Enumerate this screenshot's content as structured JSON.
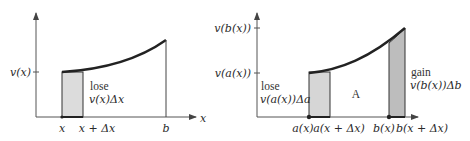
{
  "figure": {
    "left_panel": {
      "y_tick_label": "v(x)",
      "x_axis_label": "x",
      "x_ticks": [
        "x",
        "x + Δx",
        "b"
      ],
      "annotation_line1": "lose",
      "annotation_line2": "v(x)Δx"
    },
    "right_panel": {
      "y_tick_labels": [
        "v(b(x))",
        "v(a(x))"
      ],
      "x_axis_label": "x",
      "x_ticks": [
        "a(x)",
        "a(x + Δx)",
        "b(x)",
        "b(x + Δx)"
      ],
      "lose_line1": "lose",
      "lose_line2": "v(a(x))Δa",
      "gain_line1": "gain",
      "gain_line2": "v(b(x))Δb",
      "region_label": "A"
    },
    "colors": {
      "stroke": "#2b2b2b",
      "shade_light": "#d9d9d9",
      "shade_dark": "#b8b8b8",
      "curve": "#222222"
    }
  }
}
